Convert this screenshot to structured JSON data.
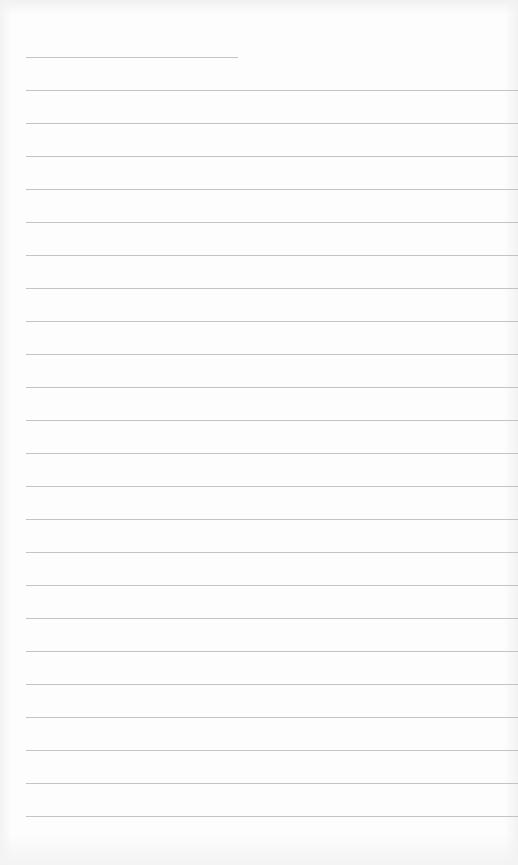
{
  "document": {
    "type": "lined-paper",
    "background_color": "#fdfdfd",
    "rule_color": "#b9b9b9",
    "first_rule": {
      "top": 57,
      "left": 26,
      "width": 212
    },
    "rules": {
      "count": 23,
      "first_top": 90,
      "spacing": 33,
      "left": 26,
      "right_edge": 518
    }
  }
}
